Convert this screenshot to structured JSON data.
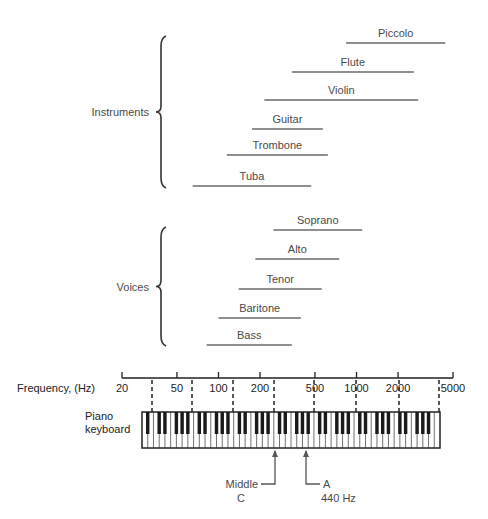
{
  "chart_data": {
    "type": "range-bar",
    "title": "",
    "xlabel": "Frequency, (Hz)",
    "x_scale": "log",
    "xlim": [
      20,
      5000
    ],
    "x_ticks": [
      20,
      50,
      100,
      200,
      500,
      1000,
      2000,
      5000
    ],
    "groups": [
      {
        "name": "Instruments",
        "items": [
          {
            "label": "Piccolo",
            "low": 840,
            "high": 4400
          },
          {
            "label": "Flute",
            "low": 340,
            "high": 2600
          },
          {
            "label": "Violin",
            "low": 215,
            "high": 2800
          },
          {
            "label": "Guitar",
            "low": 175,
            "high": 570
          },
          {
            "label": "Trombone",
            "low": 115,
            "high": 620
          },
          {
            "label": "Tuba",
            "low": 65,
            "high": 470
          }
        ]
      },
      {
        "name": "Voices",
        "items": [
          {
            "label": "Soprano",
            "low": 250,
            "high": 1100
          },
          {
            "label": "Alto",
            "low": 185,
            "high": 750
          },
          {
            "label": "Tenor",
            "low": 140,
            "high": 560
          },
          {
            "label": "Baritone",
            "low": 100,
            "high": 395
          },
          {
            "label": "Bass",
            "low": 82,
            "high": 340
          }
        ]
      }
    ],
    "annotations": [
      {
        "label": "Middle C",
        "freq": 262
      },
      {
        "label": "A 440 Hz",
        "freq": 440
      }
    ]
  },
  "labels": {
    "frequency_axis": "Frequency, (Hz)",
    "piano_line1": "Piano",
    "piano_line2": "keyboard",
    "middle_c_line1": "Middle",
    "middle_c_line2": "C",
    "a440_line1": "A",
    "a440_line2": "440 Hz"
  },
  "colors": {
    "range_line": "#6a6a6a",
    "axis": "#222222",
    "text": "#4a4a4a"
  }
}
